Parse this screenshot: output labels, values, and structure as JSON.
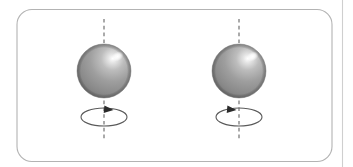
{
  "figure": {
    "canvas": {
      "width": 353,
      "height": 167,
      "background": "#ffffff"
    },
    "frame": {
      "name": "rounded-panel-border",
      "x": 17,
      "y": 9.5,
      "width": 315,
      "height": 152,
      "radius": 15,
      "stroke": "#b3b3b3",
      "stroke_width": 1.1,
      "fill": "none"
    },
    "right_rule": {
      "name": "right-margin-rule",
      "x": 342.5,
      "y1": 0,
      "y2": 167,
      "stroke": "#cfcfcf",
      "stroke_width": 1.1
    },
    "colors": {
      "frame_stroke": "#b3b3b3",
      "rule_stroke": "#cfcfcf",
      "axis_dash": "#8f8f8f",
      "orbit_stroke": "#5b5b5b",
      "arrow_fill": "#2b2b2b",
      "sphere_highlight": "#ffffff",
      "sphere_light": "#d4d4d4",
      "sphere_mid": "#9c9c9c",
      "sphere_dark": "#7d7d7d",
      "sphere_edge": "#6e6e6e"
    },
    "objects": [
      {
        "id": "left",
        "label": "Left spinning sphere",
        "sphere": {
          "cx": 104,
          "cy": 71,
          "r": 27
        },
        "axis": {
          "x": 104,
          "y1": 19,
          "y2": 141,
          "dash": "3.6 3.2"
        },
        "orbit": {
          "cx": 104,
          "cy": 117,
          "rx": 23,
          "ry": 9
        },
        "arrow": {
          "x": 110,
          "y": 110,
          "direction": "right",
          "size": 7
        }
      },
      {
        "id": "right",
        "label": "Right spinning sphere",
        "sphere": {
          "cx": 239,
          "cy": 71,
          "r": 27
        },
        "axis": {
          "x": 239,
          "y1": 19,
          "y2": 141,
          "dash": "3.6 3.2"
        },
        "orbit": {
          "cx": 239,
          "cy": 117,
          "rx": 23,
          "ry": 9
        },
        "arrow": {
          "x": 233,
          "y": 110,
          "direction": "right",
          "size": 7
        }
      }
    ]
  }
}
